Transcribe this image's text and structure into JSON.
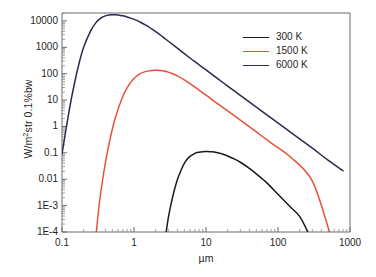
{
  "chart_data": {
    "type": "line",
    "title": "",
    "subtitle": "",
    "xlabel": "µm",
    "ylabel_html": "W/m<sup>2</sup>str 0.1%bw",
    "ylabel_text": "W/m2str 0.1%bw",
    "xscale": "log",
    "yscale": "log",
    "xlim": [
      0.1,
      1000
    ],
    "ylim": [
      0.0001,
      20000
    ],
    "grid": false,
    "legend_position": "upper-right",
    "xticks": [
      {
        "value": 0.1,
        "label": "0.1"
      },
      {
        "value": 1,
        "label": "1"
      },
      {
        "value": 10,
        "label": "10"
      },
      {
        "value": 100,
        "label": "100"
      },
      {
        "value": 1000,
        "label": "1000"
      }
    ],
    "yticks": [
      {
        "value": 10000,
        "label": "10000"
      },
      {
        "value": 1000,
        "label": "1000"
      },
      {
        "value": 100,
        "label": "100"
      },
      {
        "value": 10,
        "label": "10"
      },
      {
        "value": 1,
        "label": "1"
      },
      {
        "value": 0.1,
        "label": "0.1"
      },
      {
        "value": 0.01,
        "label": "0.01"
      },
      {
        "value": 0.001,
        "label": "1E-3"
      },
      {
        "value": 0.0001,
        "label": "1E-4"
      }
    ],
    "series": [
      {
        "name": "300 K",
        "color": "#1a1a1a",
        "temperature_K": 300,
        "peak_wavelength_um": 12,
        "peak_value": 0.11,
        "x": [
          2.8,
          3.0,
          3.3,
          3.6,
          4.0,
          4.5,
          5.0,
          5.5,
          6.0,
          7.0,
          8.0,
          9.0,
          10.0,
          11.0,
          12.0,
          13.0,
          14.0,
          16.0,
          18.0,
          20.0,
          25.0,
          30.0,
          40.0,
          50.0,
          70.0,
          100.0,
          150.0,
          200.0,
          260.0
        ],
        "y": [
          0.0001,
          0.00035,
          0.0013,
          0.0035,
          0.0095,
          0.022,
          0.04,
          0.058,
          0.073,
          0.096,
          0.106,
          0.111,
          0.112,
          0.111,
          0.11,
          0.107,
          0.103,
          0.094,
          0.085,
          0.076,
          0.058,
          0.044,
          0.026,
          0.016,
          0.0073,
          0.0027,
          0.00087,
          0.00039,
          0.0001
        ]
      },
      {
        "name": "1500 K",
        "color": "#e8503c",
        "temperature_K": 1500,
        "peak_wavelength_um": 2.1,
        "peak_value": 135,
        "x": [
          0.3,
          0.33,
          0.38,
          0.45,
          0.55,
          0.7,
          0.85,
          1.0,
          1.2,
          1.4,
          1.6,
          1.8,
          2.0,
          2.1,
          2.3,
          2.6,
          3.0,
          3.5,
          4.0,
          5.0,
          6.0,
          8.0,
          10.0,
          14.0,
          20.0,
          30.0,
          50.0,
          80.0,
          150.0,
          300.0,
          520.0
        ],
        "y": [
          0.0001,
          0.0012,
          0.018,
          0.22,
          2.1,
          14.0,
          38.0,
          66.0,
          98.0,
          117.0,
          128.0,
          133.0,
          135.0,
          135.0,
          133.0,
          127.0,
          115.0,
          98.0,
          83.0,
          58.0,
          42.0,
          24.0,
          15.5,
          7.8,
          3.9,
          1.75,
          0.62,
          0.24,
          0.068,
          0.0085,
          0.0001
        ]
      },
      {
        "name": "6000 K",
        "color": "#2a2a50",
        "temperature_K": 6000,
        "peak_wavelength_um": 0.6,
        "peak_value": 17000,
        "x": [
          0.1,
          0.12,
          0.14,
          0.17,
          0.2,
          0.25,
          0.3,
          0.35,
          0.4,
          0.45,
          0.5,
          0.55,
          0.6,
          0.65,
          0.7,
          0.8,
          0.9,
          1.0,
          1.2,
          1.5,
          2.0,
          2.5,
          3.0,
          4.0,
          5.0,
          7.0,
          10.0,
          15.0,
          20.0,
          30.0,
          50.0,
          80.0,
          150.0,
          300.0,
          500.0,
          800.0
        ],
        "y": [
          0.09,
          1.9,
          19.0,
          210.0,
          1000.0,
          4200.0,
          9000.0,
          13000.0,
          15600.0,
          16800.0,
          17100.0,
          17000.0,
          16700.0,
          16200.0,
          15600.0,
          14200.0,
          12800.0,
          11500.0,
          9200.0,
          6600.0,
          3900.0,
          2500.0,
          1700.0,
          930.0,
          580.0,
          285.0,
          140.0,
          61.0,
          34.0,
          15.0,
          5.4,
          2.1,
          0.6,
          0.15,
          0.052,
          0.021
        ]
      }
    ]
  },
  "legend": {
    "items": [
      {
        "label": "300 K",
        "color": "#1a1a1a"
      },
      {
        "label": "1500 K",
        "color": "#e8503c"
      },
      {
        "label": "6000 K",
        "color": "#2a2a50"
      }
    ]
  },
  "axes": {
    "x_title": "µm",
    "y_title": "W/m2str 0.1%bw"
  }
}
